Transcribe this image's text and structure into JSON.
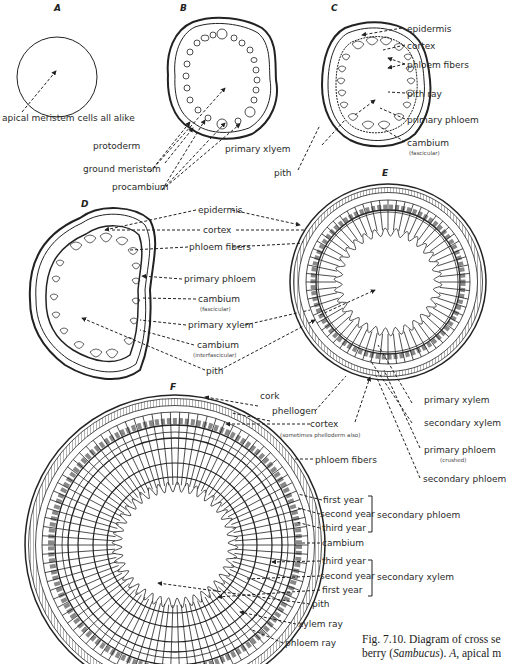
{
  "figure": {
    "panels": [
      "A",
      "B",
      "C",
      "D",
      "E",
      "F"
    ],
    "caption": {
      "line1": "Fig. 7.10. Diagram of cross se",
      "line2_prefix": "berry (",
      "line2_italic": "Sambucus",
      "line2_mid": "). ",
      "line2_italic2": "A",
      "line2_suffix": ", apical m"
    }
  },
  "labels": {
    "A": {
      "apical": "apical meristem cells all alike"
    },
    "B": {
      "protoderm": "protoderm",
      "ground_meristem": "ground meristem",
      "procambium": "procambium"
    },
    "C": {
      "epidermis": "epidermis",
      "cortex": "cortex",
      "phloem_fibers": "phloem fibers",
      "pith_ray": "pith ray",
      "primary_phloem": "primary phloem",
      "cambium": "cambium",
      "cambium_sub": "(fascicular)",
      "primary_xylem": "primary xlyem",
      "pith": "pith"
    },
    "D": {
      "epidermis": "epidermis",
      "cortex": "cortex",
      "phloem_fibers": "phloem fibers",
      "primary_phloem": "primary phloem",
      "cambium": "cambium",
      "cambium_sub": "(fascicular)",
      "primary_xylem": "primary xylem",
      "cambium2": "cambium",
      "cambium2_sub": "(interfascicular)",
      "pith": "pith"
    },
    "E": {
      "primary_xylem": "primary xylem",
      "secondary_xylem": "secondary xylem",
      "primary_phloem": "primary phloem",
      "primary_phloem_sub": "(crushed)",
      "secondary_phloem": "secondary phloem"
    },
    "F": {
      "cork": "cork",
      "phellogen": "phellogen",
      "cortex": "cortex",
      "cortex_sub": "(sometimes phelloderm also)",
      "phloem_fibers": "phloem fibers",
      "sp_first": "first year",
      "sp_second": "second year",
      "sp_third": "third year",
      "sp_group": "secondary phloem",
      "cambium": "cambium",
      "sx_third": "third year",
      "sx_second": "second year",
      "sx_first": "first year",
      "sx_group": "secondary xylem",
      "pith": "pith",
      "xylem_ray": "xylem ray",
      "phloem_ray": "phloem ray"
    }
  }
}
